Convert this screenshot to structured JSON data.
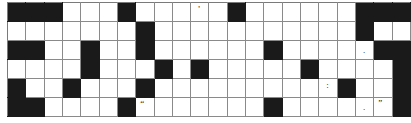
{
  "puzzle": {
    "title": "",
    "rows": 6,
    "cols": 22,
    "cell_size_px": 18,
    "colors": {
      "block": "#1a1a1a",
      "empty": "#ffffff",
      "grid_line": "#8a8a8a",
      "mark_text": "#111111"
    },
    "legend": {
      "block_label": "blocked-cell",
      "empty_label": "open-cell"
    },
    "grid": [
      [
        "B",
        "B",
        "B",
        "W",
        "W",
        "W",
        "B",
        "W",
        "W",
        "W",
        "W",
        "W",
        "B",
        "W",
        "W",
        "W",
        "W",
        "W",
        "W",
        "B",
        "B",
        "B"
      ],
      [
        "W",
        "W",
        "W",
        "W",
        "W",
        "W",
        "W",
        "B",
        "W",
        "W",
        "W",
        "W",
        "W",
        "W",
        "W",
        "W",
        "W",
        "W",
        "W",
        "B",
        "W",
        "W"
      ],
      [
        "B",
        "B",
        "W",
        "W",
        "B",
        "W",
        "W",
        "B",
        "W",
        "W",
        "W",
        "W",
        "W",
        "W",
        "B",
        "W",
        "W",
        "W",
        "W",
        "W",
        "B",
        "B"
      ],
      [
        "W",
        "W",
        "W",
        "W",
        "B",
        "W",
        "W",
        "W",
        "B",
        "W",
        "B",
        "W",
        "W",
        "W",
        "W",
        "W",
        "B",
        "W",
        "W",
        "W",
        "W",
        "B"
      ],
      [
        "B",
        "W",
        "W",
        "B",
        "W",
        "W",
        "W",
        "B",
        "W",
        "W",
        "W",
        "W",
        "W",
        "W",
        "W",
        "W",
        "W",
        "W",
        "B",
        "W",
        "W",
        "B"
      ],
      [
        "B",
        "B",
        "W",
        "W",
        "W",
        "W",
        "B",
        "W",
        "W",
        "W",
        "W",
        "W",
        "W",
        "W",
        "B",
        "W",
        "W",
        "W",
        "W",
        "W",
        "W",
        "B"
      ]
    ],
    "marks": [
      {
        "row": 0,
        "col": 10,
        "text": "'",
        "kind": "apos",
        "name": "apostrophe-mark"
      },
      {
        "row": 2,
        "col": 19,
        "text": ".",
        "kind": "dot",
        "name": "period-mark"
      },
      {
        "row": 4,
        "col": 17,
        "text": ":",
        "kind": "colon",
        "name": "colon-mark"
      },
      {
        "row": 5,
        "col": 7,
        "text": "“",
        "kind": "dquote",
        "name": "open-quote-mark"
      },
      {
        "row": 5,
        "col": 19,
        "text": ".",
        "kind": "dot",
        "name": "period-mark"
      },
      {
        "row": 5,
        "col": 20,
        "text": "”",
        "kind": "dquote",
        "name": "close-quote-mark"
      }
    ]
  }
}
